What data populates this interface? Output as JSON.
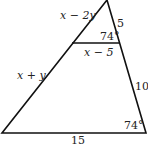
{
  "diagram": {
    "type": "geometry-triangle",
    "labels": {
      "upper_left_side": "x − 2y",
      "upper_right_side": "5",
      "top_angle": "74°",
      "midsegment": "x − 5",
      "lower_left_side": "x + y",
      "lower_right_side": "10",
      "bottom_angle": "74°",
      "base": "15"
    }
  }
}
